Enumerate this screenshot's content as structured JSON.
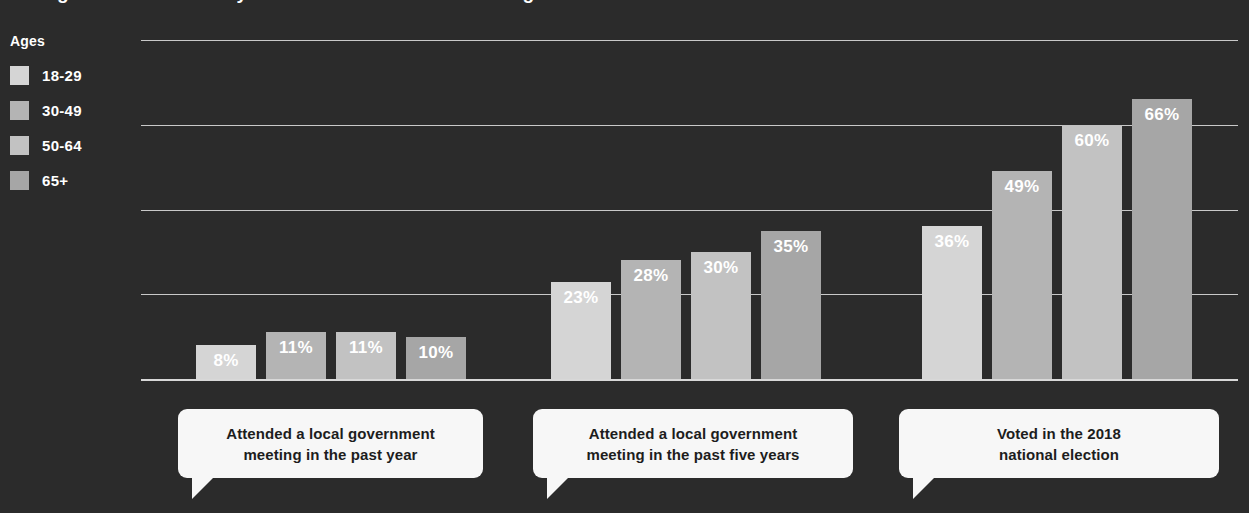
{
  "chart_title": "Younger adults less likely to vote or attend local meetings",
  "legend": {
    "title": "Ages",
    "items": [
      {
        "label": "18-29",
        "color": "#d5d5d5"
      },
      {
        "label": "30-49",
        "color": "#b4b4b4"
      },
      {
        "label": "50-64",
        "color": "#c2c2c2"
      },
      {
        "label": "65+",
        "color": "#a6a6a6"
      }
    ]
  },
  "background_color": "#2b2b2b",
  "gridline_color": "#c9c9c9",
  "value_label_color": "#ffffff",
  "callout_background": "#f7f7f7",
  "chart_data": {
    "type": "bar",
    "title": "Younger adults less likely to vote or attend local meetings",
    "xlabel": "",
    "ylabel": "",
    "ylim": [
      0,
      80
    ],
    "grid": true,
    "legend_position": "left",
    "value_suffix": "%",
    "gridline_values": [
      20,
      40,
      60,
      80
    ],
    "categories": [
      "Attended a local government meeting in the past year",
      "Attended a local government meeting in the past five years",
      "Voted in the 2018 national election"
    ],
    "series": [
      {
        "name": "18-29",
        "color": "#d5d5d5",
        "values": [
          8,
          23,
          36
        ],
        "labels": [
          "8%",
          "23%",
          "36%"
        ]
      },
      {
        "name": "30-49",
        "color": "#b4b4b4",
        "values": [
          11,
          28,
          49
        ],
        "labels": [
          "11%",
          "28%",
          "49%"
        ]
      },
      {
        "name": "50-64",
        "color": "#c2c2c2",
        "values": [
          11,
          30,
          60
        ],
        "labels": [
          "11%",
          "30%",
          "60%"
        ]
      },
      {
        "name": "65+",
        "color": "#a6a6a6",
        "values": [
          10,
          35,
          66
        ],
        "labels": [
          "10%",
          "35%",
          "66%"
        ]
      }
    ]
  },
  "callouts": [
    {
      "line1": "Attended a local government",
      "line2": "meeting in the past year",
      "left": 178,
      "width": 305
    },
    {
      "line1": "Attended a local government",
      "line2": "meeting in the past five years",
      "left": 533,
      "width": 320
    },
    {
      "line1": "Voted in the 2018",
      "line2": "national election",
      "left": 899,
      "width": 320
    }
  ]
}
